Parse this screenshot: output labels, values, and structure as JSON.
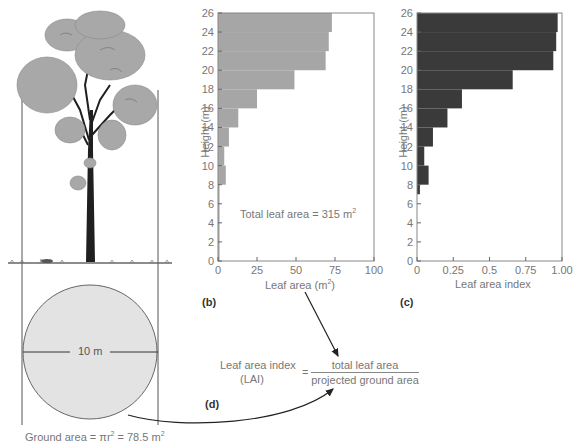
{
  "chart_data": [
    {
      "id": "b",
      "type": "bar",
      "orientation": "horizontal",
      "panel_label": "(b)",
      "title": "",
      "xlabel": "Leaf area (m²)",
      "ylabel": "Height (m)",
      "xlim": [
        0,
        100
      ],
      "ylim": [
        0,
        26
      ],
      "xticks": [
        "0",
        "25",
        "50",
        "75",
        "100"
      ],
      "yticks": [
        "0",
        "2",
        "4",
        "6",
        "8",
        "10",
        "12",
        "14",
        "16",
        "18",
        "20",
        "22",
        "24",
        "26"
      ],
      "bar_color": "#a6a6a6",
      "height_bins": [
        [
          0,
          8
        ],
        [
          8,
          10
        ],
        [
          10,
          12
        ],
        [
          12,
          14
        ],
        [
          14,
          16
        ],
        [
          16,
          18
        ],
        [
          18,
          20
        ],
        [
          20,
          22
        ],
        [
          22,
          24
        ],
        [
          24,
          26
        ]
      ],
      "values": [
        1,
        5,
        4,
        7,
        13,
        25,
        49,
        69,
        71,
        73
      ],
      "annotation": "Total leaf area = 315 m²",
      "grid": false
    },
    {
      "id": "c",
      "type": "bar",
      "orientation": "horizontal",
      "panel_label": "(c)",
      "title": "",
      "xlabel": "Leaf area index",
      "ylabel": "Height (m)",
      "xlim": [
        0,
        1.0
      ],
      "ylim": [
        0,
        26
      ],
      "xticks": [
        "0",
        "0.25",
        "0.5",
        "0.75",
        "1.00"
      ],
      "yticks": [
        "0",
        "2",
        "4",
        "6",
        "8",
        "10",
        "12",
        "14",
        "16",
        "18",
        "20",
        "22",
        "24",
        "26"
      ],
      "bar_color": "#3a3a3a",
      "height_bins": [
        [
          7,
          8
        ],
        [
          8,
          10
        ],
        [
          10,
          12
        ],
        [
          12,
          14
        ],
        [
          14,
          16
        ],
        [
          16,
          18
        ],
        [
          18,
          20
        ],
        [
          20,
          22
        ],
        [
          22,
          24
        ],
        [
          24,
          26
        ]
      ],
      "values": [
        0.02,
        0.08,
        0.05,
        0.11,
        0.21,
        0.31,
        0.66,
        0.94,
        0.96,
        0.97
      ],
      "grid": false
    }
  ],
  "illustration": {
    "tree_label": "tree",
    "diameter_label": "10 m",
    "ground_area_label": "Ground area = πr",
    "ground_area_sup": "2",
    "ground_area_value": " = 78.5 m",
    "ground_area_unit_sup": "2"
  },
  "formula": {
    "panel_label": "(d)",
    "lhs_line1": "Leaf area index",
    "lhs_line2": "(LAI)",
    "equals": "=",
    "numerator": "total leaf area",
    "denominator": "projected ground area"
  },
  "chart_b": {
    "annotation_prefix": "Total leaf area = 315 m",
    "annotation_sup": "2",
    "xlabel_prefix": "Leaf area (m",
    "xlabel_sup": "2",
    "xlabel_suffix": ")",
    "ylabel": "Height (m)",
    "panel_label": "(b)"
  },
  "chart_c": {
    "xlabel": "Leaf area index",
    "ylabel": "Height (m)",
    "panel_label": "(c)"
  }
}
